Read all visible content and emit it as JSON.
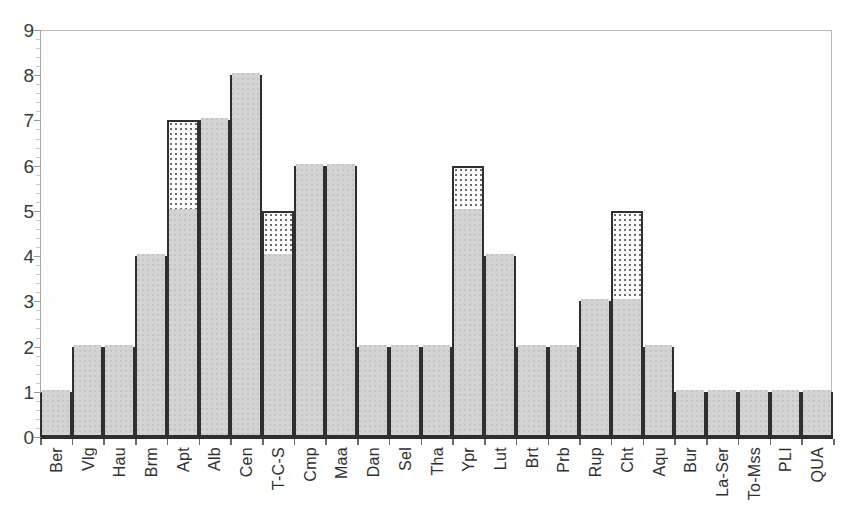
{
  "chart_data": {
    "type": "bar",
    "title": "",
    "subtitle": "",
    "xlabel": "",
    "ylabel": "",
    "ylim": [
      0,
      9
    ],
    "y_ticks": [
      0,
      1,
      2,
      3,
      4,
      5,
      6,
      7,
      8,
      9
    ],
    "grid": false,
    "legend": null,
    "legend_position": "none",
    "stacked": true,
    "categories": [
      "Ber",
      "Vlg",
      "Hau",
      "Brm",
      "Apt",
      "Alb",
      "Cen",
      "T-C-S",
      "Cmp",
      "Maa",
      "Dan",
      "Sel",
      "Tha",
      "Ypr",
      "Lut",
      "Brt",
      "Prb",
      "Rup",
      "Cht",
      "Aqu",
      "Bur",
      "La-Ser",
      "To-Mss",
      "PLI",
      "QUA"
    ],
    "series": [
      {
        "name": "solid-gray",
        "fill": "gray-stipple",
        "values": [
          1,
          2,
          2,
          4,
          5,
          7,
          8,
          4,
          6,
          6,
          2,
          2,
          2,
          5,
          4,
          2,
          2,
          3,
          3,
          2,
          1,
          1,
          1,
          1,
          1
        ]
      },
      {
        "name": "dotted-white",
        "fill": "white-dotted",
        "values": [
          0,
          0,
          0,
          0,
          2,
          0,
          0,
          1,
          0,
          0,
          0,
          0,
          0,
          1,
          0,
          0,
          0,
          0,
          2,
          0,
          0,
          0,
          0,
          0,
          0
        ]
      }
    ],
    "totals": [
      1,
      2,
      2,
      4,
      7,
      7,
      8,
      5,
      6,
      6,
      2,
      2,
      2,
      6,
      4,
      2,
      2,
      3,
      5,
      2,
      1,
      1,
      1,
      1,
      1
    ],
    "colors": {
      "bar_fill_gray": "#d4d4d4",
      "bar_fill_dotted": "#ffffff",
      "bar_outline": "#2f2f2f",
      "axis": "#2f2f2f",
      "frame": "#b9b9b9",
      "tick_label": "#3a3a3a",
      "background": "#ffffff"
    }
  }
}
